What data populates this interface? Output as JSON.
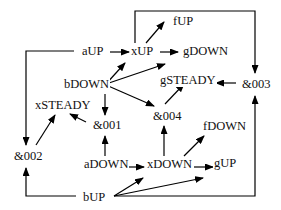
{
  "diagram": {
    "type": "directed-graph",
    "nodes": {
      "fUP": "fUP",
      "aUP": "aUP",
      "xUP": "xUP",
      "gDOWN": "gDOWN",
      "bDOWN": "bDOWN",
      "gSTEADY": "gSTEADY",
      "amp003": "&003",
      "xSTEADY": "xSTEADY",
      "amp001": "&001",
      "amp004": "&004",
      "fDOWN": "fDOWN",
      "amp002": "&002",
      "aDOWN": "aDOWN",
      "xDOWN": "xDOWN",
      "gUP": "gUP",
      "bUP": "bUP"
    },
    "edges": [
      {
        "from": "aUP",
        "to": "xUP"
      },
      {
        "from": "aUP",
        "to": "&002"
      },
      {
        "from": "xUP",
        "to": "fUP"
      },
      {
        "from": "xUP",
        "to": "gDOWN"
      },
      {
        "from": "xUP",
        "to": "&003"
      },
      {
        "from": "bDOWN",
        "to": "xUP"
      },
      {
        "from": "bDOWN",
        "to": "gDOWN"
      },
      {
        "from": "bDOWN",
        "to": "&001"
      },
      {
        "from": "bDOWN",
        "to": "&004"
      },
      {
        "from": "&003",
        "to": "gSTEADY"
      },
      {
        "from": "&004",
        "to": "gSTEADY"
      },
      {
        "from": "&001",
        "to": "xSTEADY"
      },
      {
        "from": "&002",
        "to": "xSTEADY"
      },
      {
        "from": "aDOWN",
        "to": "&001"
      },
      {
        "from": "aDOWN",
        "to": "xDOWN"
      },
      {
        "from": "xDOWN",
        "to": "&004"
      },
      {
        "from": "xDOWN",
        "to": "fDOWN"
      },
      {
        "from": "xDOWN",
        "to": "gUP"
      },
      {
        "from": "bUP",
        "to": "&002"
      },
      {
        "from": "bUP",
        "to": "xDOWN"
      },
      {
        "from": "bUP",
        "to": "gUP"
      },
      {
        "from": "bUP",
        "to": "&003"
      }
    ]
  }
}
